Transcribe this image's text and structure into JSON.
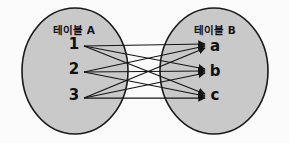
{
  "diagram": {
    "kind": "many-to-many-relationship-diagram",
    "background_color": "#fbfbfb",
    "ellipse_fill": "#c9c9c9",
    "ellipse_stroke": "#1a1a1a",
    "edge_color": "#141414",
    "left_group": {
      "title": "테이블 A",
      "nodes": [
        {
          "label": "1",
          "x": 74,
          "y": 49
        },
        {
          "label": "2",
          "x": 74,
          "y": 74
        },
        {
          "label": "3",
          "x": 74,
          "y": 100
        }
      ],
      "ellipse": {
        "cx": 75,
        "cy": 71,
        "rx": 53,
        "ry": 63
      },
      "title_pos": {
        "x": 74,
        "y": 34
      }
    },
    "right_group": {
      "title": "테이블 B",
      "nodes": [
        {
          "label": "a",
          "x": 215,
          "y": 51
        },
        {
          "label": "b",
          "x": 215,
          "y": 76
        },
        {
          "label": "c",
          "x": 215,
          "y": 100
        }
      ],
      "ellipse": {
        "cx": 214,
        "cy": 71,
        "rx": 54,
        "ry": 63
      },
      "title_pos": {
        "x": 215,
        "y": 34
      }
    },
    "edges": [
      {
        "from": "1",
        "to": "a"
      },
      {
        "from": "1",
        "to": "b"
      },
      {
        "from": "1",
        "to": "c"
      },
      {
        "from": "2",
        "to": "a"
      },
      {
        "from": "2",
        "to": "b"
      },
      {
        "from": "2",
        "to": "c"
      },
      {
        "from": "3",
        "to": "a"
      },
      {
        "from": "3",
        "to": "b"
      },
      {
        "from": "3",
        "to": "c"
      }
    ],
    "edge_geometry": {
      "source_x": 84,
      "target_x": 205,
      "source_y": {
        "1": 46,
        "2": 72,
        "3": 98
      },
      "target_y": {
        "a": 46,
        "b": 71,
        "c": 96
      },
      "target_offsets": {
        "a": [
          -2,
          0,
          2
        ],
        "b": [
          -2,
          0,
          2
        ],
        "c": [
          -2,
          0,
          2
        ]
      }
    }
  }
}
